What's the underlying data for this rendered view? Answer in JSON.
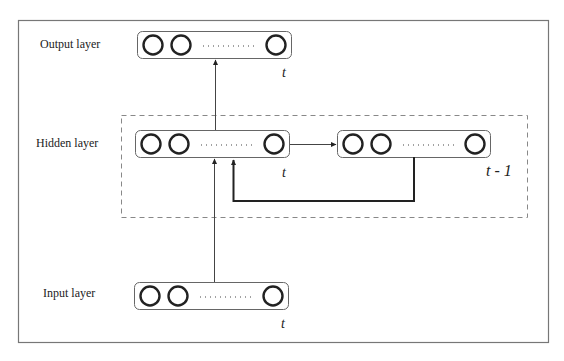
{
  "diagram": {
    "type": "recurrent-neural-network (Elman)",
    "colors": {
      "stroke": "#222222",
      "frame": "#777777",
      "dashed": "#888888",
      "box": "#666666",
      "background": "#ffffff"
    },
    "layers": {
      "output": {
        "label": "Output layer",
        "time": "t"
      },
      "hidden": {
        "label": "Hidden layer",
        "time": "t"
      },
      "context": {
        "time": "t - 1"
      },
      "input": {
        "label": "Input layer",
        "time": "t"
      }
    },
    "connections": [
      {
        "from": "input",
        "to": "hidden"
      },
      {
        "from": "hidden",
        "to": "output"
      },
      {
        "from": "hidden",
        "to": "context"
      },
      {
        "from": "context",
        "to": "hidden",
        "style": "feedback"
      }
    ]
  }
}
